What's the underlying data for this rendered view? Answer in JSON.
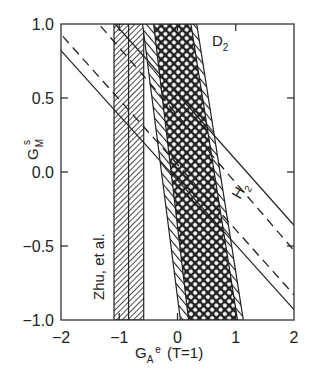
{
  "chart_data": {
    "type": "line",
    "title": "",
    "xlabel": "G_A^e (T=1)",
    "ylabel": "G_M^s",
    "xlim": [
      -2,
      2
    ],
    "ylim": [
      -1,
      1
    ],
    "x_ticks": [
      "-2",
      "-1",
      "0",
      "1",
      "2"
    ],
    "y_ticks": [
      "1.0",
      "0.5",
      "0.0",
      "-0.5",
      "-1.0"
    ],
    "grid": false,
    "series": [
      {
        "name": "H2 solid (lower)",
        "style": "solid",
        "points": [
          [
            -2,
            0.82
          ],
          [
            2,
            -0.93
          ]
        ]
      },
      {
        "name": "H2 dashed (lower)",
        "style": "dashed",
        "points": [
          [
            -2,
            0.93
          ],
          [
            2,
            -0.83
          ]
        ]
      },
      {
        "name": "D2 dashed (upper)",
        "style": "dashed",
        "points": [
          [
            -1.35,
            1.0
          ],
          [
            2,
            -0.53
          ]
        ]
      },
      {
        "name": "D2 solid (upper)",
        "style": "solid",
        "points": [
          [
            -1.07,
            1.0
          ],
          [
            2,
            -0.36
          ]
        ]
      }
    ],
    "bands": [
      {
        "name": "Zhu, et al.",
        "fill": "diagonal-hatch",
        "x_range": [
          -1.09,
          -0.58
        ],
        "center": -0.84
      },
      {
        "name": "D2 inner band",
        "fill": "crosshatch",
        "top": [
          -0.41,
          0.23
        ],
        "bottom": [
          0.19,
          1.03
        ]
      },
      {
        "name": "D2 outer band",
        "fill": "diagonal-hatch-border",
        "top": [
          -0.6,
          0.33
        ],
        "bottom": [
          0.05,
          1.13
        ]
      }
    ],
    "annotations": [
      {
        "text": "D2",
        "x": 0.6,
        "y": 0.9
      },
      {
        "text": "H2",
        "x": 1.05,
        "y": -0.25,
        "rotation": -55
      },
      {
        "text": "Zhu, et al.",
        "x": -1.5,
        "y": -0.7,
        "rotation": -90
      }
    ]
  },
  "axes": {
    "xlabel_main": "G",
    "xlabel_sub": "A",
    "xlabel_sup": "e",
    "xlabel_suffix": "(T=1)",
    "ylabel_main": "G",
    "ylabel_sub": "M",
    "ylabel_sup": "s",
    "x_ticks": [
      {
        "label": "−2",
        "value": -2
      },
      {
        "label": "−1",
        "value": -1
      },
      {
        "label": "0",
        "value": 0
      },
      {
        "label": "1",
        "value": 1
      },
      {
        "label": "2",
        "value": 2
      }
    ],
    "y_ticks": [
      {
        "label": "1.0",
        "value": 1.0
      },
      {
        "label": "0.5",
        "value": 0.5
      },
      {
        "label": "0.0",
        "value": 0.0
      },
      {
        "label": "−0.5",
        "value": -0.5
      },
      {
        "label": "−1.0",
        "value": -1.0
      }
    ]
  },
  "labels": {
    "d2_main": "D",
    "d2_sub": "2",
    "h2_main": "H",
    "h2_sub": "2",
    "zhu": "Zhu, et al."
  },
  "colors": {
    "ink": "#222222",
    "background": "#ffffff"
  }
}
